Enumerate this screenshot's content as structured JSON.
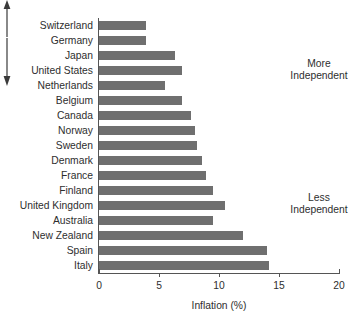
{
  "chart_data": {
    "type": "bar",
    "orientation": "horizontal",
    "title": "",
    "xlabel": "Inflation (%)",
    "ylabel": "",
    "xlim": [
      0,
      20
    ],
    "xticks": [
      0,
      5,
      10,
      15,
      20
    ],
    "xtick_labels": [
      "0",
      "5",
      "10",
      "15",
      "20"
    ],
    "grid": false,
    "legend": null,
    "bar_color": "#6f6f6f",
    "categories": [
      "Switzerland",
      "Germany",
      "Japan",
      "United States",
      "Netherlands",
      "Belgium",
      "Canada",
      "Norway",
      "Sweden",
      "Denmark",
      "France",
      "Finland",
      "United Kingdom",
      "Australia",
      "New Zealand",
      "Spain",
      "Italy"
    ],
    "values": [
      3.9,
      3.9,
      6.3,
      6.9,
      5.5,
      6.9,
      7.7,
      8.0,
      8.2,
      8.6,
      8.9,
      9.5,
      10.5,
      9.5,
      12.0,
      14.0,
      14.2
    ],
    "annotations": [
      {
        "text_line1": "More",
        "text_line2": "Independent",
        "direction": "up"
      },
      {
        "text_line1": "Less",
        "text_line2": "Independent",
        "direction": "down"
      }
    ]
  },
  "axis": {
    "x_title": "Inflation (%)"
  },
  "annotations": {
    "more": {
      "line1": "More",
      "line2": "Independent"
    },
    "less": {
      "line1": "Less",
      "line2": "Independent"
    }
  }
}
